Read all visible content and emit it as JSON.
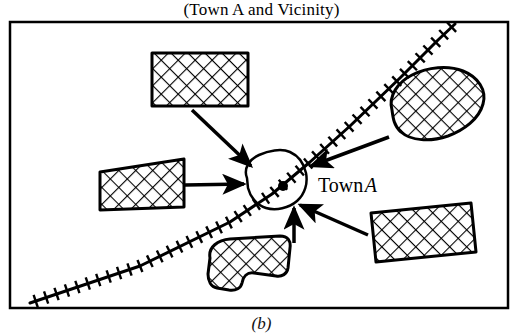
{
  "figure": {
    "title": "(Town A and Vicinity)",
    "caption": "(b)",
    "frame": {
      "x": 10,
      "y": 22,
      "width": 498,
      "height": 286,
      "stroke_color": "#000000",
      "stroke_width": 2.5,
      "fill_color": "#ffffff"
    }
  },
  "map": {
    "town_label": "Town",
    "town_label_italic": "A",
    "town_label_position": {
      "x": 318,
      "y": 192
    },
    "town_center_dot": {
      "x": 283,
      "y": 186,
      "radius": 5,
      "color": "#000000"
    },
    "town_boundary": {
      "name": "town-a-boundary",
      "path": "M 247 178 C 243 168 250 159 259 155 C 268 151 281 148 290 152 C 299 156 304 164 306 173 C 308 183 305 194 297 201 C 289 208 276 211 266 208 C 256 205 250 196 248 188 Z",
      "stroke_color": "#000000",
      "stroke_width": 2.5,
      "fill_color": "#ffffff"
    },
    "railway": {
      "name": "railway-line",
      "path": "M 30 303 L 140 266 L 230 222 L 272 194 L 310 162 L 350 126 L 400 78 L 438 40 L 455 24",
      "stroke_color": "#000000",
      "stroke_width": 3,
      "tie_length": 13,
      "tie_spacing": 11,
      "tie_width": 2.4
    },
    "hatch": {
      "stroke_color": "#000000",
      "stroke_width": 2.2,
      "spacing": 12,
      "angle_deg": 45
    },
    "regions": [
      {
        "name": "region-top-rectangle",
        "shape": "rect",
        "path": "M 152 53 L 248 53 L 248 106 L 152 106 Z",
        "stroke_color": "#000000",
        "stroke_width": 3
      },
      {
        "name": "region-left-rectangle",
        "shape": "rect",
        "path": "M 100 172 L 184 159 L 184 207 L 100 210 Z",
        "stroke_color": "#000000",
        "stroke_width": 3
      },
      {
        "name": "region-right-blob",
        "shape": "blob",
        "path": "M 392 110 C 388 96 398 82 412 75 C 428 67 448 65 463 71 C 478 77 487 90 483 104 C 479 119 464 130 448 136 C 430 142 411 141 401 132 C 394 126 393 118 392 110 Z",
        "stroke_color": "#000000",
        "stroke_width": 3
      },
      {
        "name": "region-bottom-rectangle",
        "shape": "rect",
        "path": "M 371 213 L 471 203 L 476 252 L 376 262 Z",
        "stroke_color": "#000000",
        "stroke_width": 3
      },
      {
        "name": "region-bottom-blob",
        "shape": "blob",
        "path": "M 210 258 C 208 247 218 240 230 239 L 280 236 C 288 236 291 241 290 248 L 288 268 C 287 274 282 277 276 276 L 254 273 C 247 272 243 277 242 283 C 241 288 236 291 229 290 L 217 288 C 211 287 208 281 208 274 Z",
        "stroke_color": "#000000",
        "stroke_width": 3
      }
    ],
    "arrows": [
      {
        "name": "arrow-from-top-rectangle",
        "from": {
          "x": 192,
          "y": 110
        },
        "to": {
          "x": 251,
          "y": 166
        },
        "stroke_color": "#000000",
        "stroke_width": 3.5
      },
      {
        "name": "arrow-from-left-rectangle",
        "from": {
          "x": 185,
          "y": 185
        },
        "to": {
          "x": 244,
          "y": 184
        },
        "stroke_color": "#000000",
        "stroke_width": 3.5
      },
      {
        "name": "arrow-from-right-blob",
        "from": {
          "x": 389,
          "y": 137
        },
        "to": {
          "x": 311,
          "y": 166
        },
        "stroke_color": "#000000",
        "stroke_width": 3.5
      },
      {
        "name": "arrow-from-bottom-rectangle",
        "from": {
          "x": 368,
          "y": 235
        },
        "to": {
          "x": 300,
          "y": 205
        },
        "stroke_color": "#000000",
        "stroke_width": 3.5
      },
      {
        "name": "arrow-from-bottom-blob",
        "from": {
          "x": 294,
          "y": 243
        },
        "to": {
          "x": 294,
          "y": 208
        },
        "stroke_color": "#000000",
        "stroke_width": 3.5
      }
    ]
  }
}
